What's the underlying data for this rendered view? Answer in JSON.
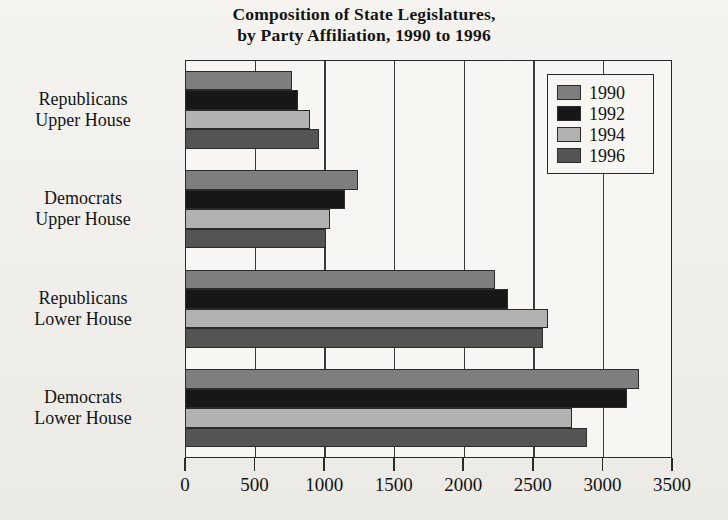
{
  "chart_data": {
    "type": "bar",
    "orientation": "horizontal",
    "title": "Composition of State Legislatures, by Party Affiliation, 1990 to 1996",
    "title_line1": "Composition of State Legislatures,",
    "title_line2": "by Party Affiliation, 1990 to 1996",
    "xlabel": "",
    "ylabel": "",
    "categories": [
      "Republicans Upper House",
      "Democrats Upper House",
      "Republicans Lower House",
      "Democrats Lower House"
    ],
    "category_lines": [
      [
        "Republicans",
        "Upper House"
      ],
      [
        "Democrats",
        "Upper House"
      ],
      [
        "Republicans",
        "Lower House"
      ],
      [
        "Democrats",
        "Lower House"
      ]
    ],
    "series": [
      {
        "name": "1990",
        "color": "#7e7e7e",
        "values": [
          770,
          1240,
          2230,
          3260
        ]
      },
      {
        "name": "1992",
        "color": "#171717",
        "values": [
          810,
          1150,
          2320,
          3180
        ]
      },
      {
        "name": "1994",
        "color": "#b2b2b2",
        "values": [
          900,
          1045,
          2610,
          2780
        ]
      },
      {
        "name": "1996",
        "color": "#545454",
        "values": [
          965,
          1010,
          2570,
          2890
        ]
      }
    ],
    "xlim": [
      0,
      3500
    ],
    "xticks": [
      0,
      500,
      1000,
      1500,
      2000,
      2500,
      3000,
      3500
    ],
    "xtick_labels": [
      "0",
      "500",
      "1000",
      "1500",
      "2000",
      "2500",
      "3000",
      "3500"
    ],
    "grid": true,
    "grid_axis": "x",
    "legend": {
      "position": "top-right-inside",
      "entries": [
        "1990",
        "1992",
        "1994",
        "1996"
      ]
    },
    "frame": true,
    "background_color": "#f2f1ed",
    "axis_color": "#2a2a2a"
  }
}
